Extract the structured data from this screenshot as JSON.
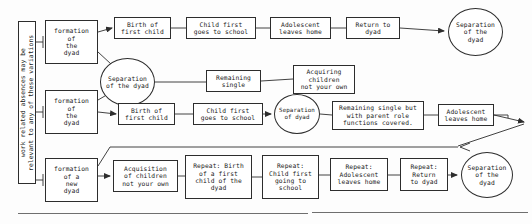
{
  "diagram": {
    "type": "flowchart",
    "side_label": {
      "text": "work related absences may be relevant to any of these variations",
      "orientation": "vertical"
    },
    "rows": {
      "row1_label": "Top pathway: dyad with child to separation",
      "row2_label": "Middle pathway: early separation variations",
      "row3_label": "Bottom pathway: new dyad with acquired children"
    },
    "nodes": [
      {
        "id": "side-label",
        "shape": "rect",
        "text": "work related absences may be\nrelevant to any of these variations",
        "x": 18,
        "y": 21,
        "w": 18,
        "h": 163
      },
      {
        "id": "formation-1",
        "shape": "rect",
        "text": "formation\nof\nthe\ndyad",
        "x": 45,
        "y": 20,
        "w": 53,
        "h": 44
      },
      {
        "id": "formation-2",
        "shape": "rect",
        "text": "formation\nof\nthe\ndyad",
        "x": 45,
        "y": 90,
        "w": 53,
        "h": 44
      },
      {
        "id": "formation-3",
        "shape": "rect",
        "text": "formation\nof a\nnew\ndyad",
        "x": 45,
        "y": 158,
        "w": 53,
        "h": 44
      },
      {
        "id": "birth-1",
        "shape": "rect",
        "text": "Birth of\nfirst child",
        "x": 114,
        "y": 17,
        "w": 57,
        "h": 22
      },
      {
        "id": "school-1",
        "shape": "rect",
        "text": "Child first\ngoes to school",
        "x": 186,
        "y": 17,
        "w": 70,
        "h": 22
      },
      {
        "id": "adolescent-1",
        "shape": "rect",
        "text": "Adolescent\nleaves home",
        "x": 270,
        "y": 17,
        "w": 61,
        "h": 22
      },
      {
        "id": "return-1",
        "shape": "rect",
        "text": "Return to\ndyad",
        "x": 346,
        "y": 17,
        "w": 54,
        "h": 22
      },
      {
        "id": "separation-1",
        "shape": "circle",
        "text": "Separation\nof the\ndyad",
        "x": 448,
        "y": 8,
        "w": 55,
        "h": 48
      },
      {
        "id": "separation-2",
        "shape": "circle",
        "text": "Separation\nof the dyad",
        "x": 100,
        "y": 58,
        "w": 55,
        "h": 48
      },
      {
        "id": "remaining-1",
        "shape": "rect",
        "text": "Remaining\nsingle",
        "x": 206,
        "y": 70,
        "w": 55,
        "h": 22
      },
      {
        "id": "acquiring-1",
        "shape": "rect",
        "text": "Acquiring\nchildren\nnot your own",
        "x": 293,
        "y": 65,
        "w": 62,
        "h": 29
      },
      {
        "id": "birth-2",
        "shape": "rect",
        "text": "Birth of\nfirst child",
        "x": 118,
        "y": 103,
        "w": 57,
        "h": 22
      },
      {
        "id": "school-2",
        "shape": "rect",
        "text": "Child first\ngoes to school",
        "x": 193,
        "y": 103,
        "w": 70,
        "h": 22
      },
      {
        "id": "separation-3",
        "shape": "circle",
        "text": "Separation\nof dyad",
        "x": 274,
        "y": 94,
        "w": 46,
        "h": 40
      },
      {
        "id": "remaining-2",
        "shape": "rect",
        "text": "Remaining single but\nwith parent role\nfunctions covered.",
        "x": 332,
        "y": 101,
        "w": 92,
        "h": 29
      },
      {
        "id": "adolescent-2",
        "shape": "rect",
        "text": "Adolescent\nleaves home",
        "x": 438,
        "y": 104,
        "w": 56,
        "h": 22
      },
      {
        "id": "acquisition-3",
        "shape": "rect",
        "text": "Acquisition\nof children\nnot your own",
        "x": 113,
        "y": 160,
        "w": 65,
        "h": 32
      },
      {
        "id": "repeat-birth",
        "shape": "rect",
        "text": "Repeat: Birth\nof a first\nchild of the\ndyad",
        "x": 185,
        "y": 155,
        "w": 67,
        "h": 44
      },
      {
        "id": "repeat-school",
        "shape": "rect",
        "text": "Repeat:\nChild first\ngoing to\nschool",
        "x": 262,
        "y": 155,
        "w": 57,
        "h": 44
      },
      {
        "id": "repeat-adol",
        "shape": "rect",
        "text": "Repeat:\nAdolescent\nleaves home",
        "x": 330,
        "y": 158,
        "w": 58,
        "h": 33
      },
      {
        "id": "repeat-return",
        "shape": "rect",
        "text": "Repeat:\nReturn\nto dyad",
        "x": 400,
        "y": 158,
        "w": 48,
        "h": 33
      },
      {
        "id": "separation-4",
        "shape": "circle",
        "text": "Separation\nof the\ndyad",
        "x": 461,
        "y": 152,
        "w": 52,
        "h": 46
      }
    ],
    "edges": [
      {
        "from": "side-label",
        "to": "formation-1",
        "arrow": false
      },
      {
        "from": "side-label",
        "to": "formation-2",
        "arrow": false
      },
      {
        "from": "side-label",
        "to": "formation-3",
        "arrow": false
      },
      {
        "from": "formation-1",
        "to": "birth-1",
        "arrow": true
      },
      {
        "from": "formation-1",
        "to": "separation-2",
        "arrow": true
      },
      {
        "from": "formation-2",
        "to": "separation-2",
        "arrow": true
      },
      {
        "from": "formation-2",
        "to": "birth-2",
        "arrow": true
      },
      {
        "from": "birth-1",
        "to": "school-1",
        "arrow": false
      },
      {
        "from": "school-1",
        "to": "adolescent-1",
        "arrow": false
      },
      {
        "from": "adolescent-1",
        "to": "return-1",
        "arrow": false
      },
      {
        "from": "return-1",
        "to": "separation-1",
        "arrow": true
      },
      {
        "from": "separation-2",
        "to": "remaining-1",
        "arrow": false
      },
      {
        "from": "remaining-1",
        "to": "acquiring-1",
        "arrow": false
      },
      {
        "from": "birth-2",
        "to": "school-2",
        "arrow": false
      },
      {
        "from": "school-2",
        "to": "separation-3",
        "arrow": true
      },
      {
        "from": "separation-3",
        "to": "remaining-2",
        "arrow": false
      },
      {
        "from": "remaining-2",
        "to": "adolescent-2",
        "arrow": false
      },
      {
        "from": "adolescent-2",
        "to": "feedback-loop",
        "arrow": true
      },
      {
        "from": "feedback-loop",
        "to": "formation-3",
        "arrow": true
      },
      {
        "from": "formation-3",
        "to": "acquisition-3",
        "arrow": true
      },
      {
        "from": "acquisition-3",
        "to": "repeat-birth",
        "arrow": false
      },
      {
        "from": "repeat-birth",
        "to": "repeat-school",
        "arrow": false
      },
      {
        "from": "repeat-school",
        "to": "repeat-adol",
        "arrow": false
      },
      {
        "from": "repeat-adol",
        "to": "repeat-return",
        "arrow": false
      },
      {
        "from": "repeat-return",
        "to": "separation-4",
        "arrow": true
      }
    ],
    "colors": {
      "stroke": "#2d2d2d",
      "fill": "#ffffff",
      "text": "#1a1a1a",
      "background": "#fdfdfd",
      "rule": "#6f6f6f"
    }
  }
}
